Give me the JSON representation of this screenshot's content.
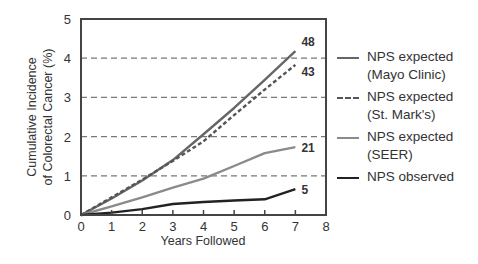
{
  "chart_data": {
    "type": "line",
    "title": "",
    "xlabel": "Years Followed",
    "ylabel": "Cumulative Incidence of Colorectal Cancer (%)",
    "ylabel_lines": [
      "Cumulative Incidence",
      "of Colorectal Cancer (%)"
    ],
    "xlim": [
      0,
      8
    ],
    "ylim": [
      0,
      5
    ],
    "xticks": [
      0,
      1,
      2,
      3,
      4,
      5,
      6,
      7,
      8
    ],
    "yticks": [
      0,
      1,
      2,
      3,
      4,
      5
    ],
    "grid": {
      "horizontal_dashed_at": [
        1,
        2,
        3,
        4
      ]
    },
    "legend_position": "right",
    "x": [
      0,
      1,
      2,
      3,
      4,
      5,
      6,
      7
    ],
    "series": [
      {
        "name": "NPS expected (Mayo Clinic)",
        "legend_lines": [
          "NPS expected",
          "(Mayo Clinic)"
        ],
        "style": "solid",
        "color": "#666666",
        "values": [
          0,
          0.42,
          0.88,
          1.4,
          2.06,
          2.73,
          3.45,
          4.18
        ],
        "end_label": "48"
      },
      {
        "name": "NPS expected (St. Mark's)",
        "legend_lines": [
          "NPS expected",
          "(St. Mark's)"
        ],
        "style": "dashed",
        "color": "#555555",
        "values": [
          0,
          0.45,
          0.9,
          1.38,
          1.88,
          2.55,
          3.2,
          3.83
        ],
        "end_label": "43"
      },
      {
        "name": "NPS expected (SEER)",
        "legend_lines": [
          "NPS expected",
          "(SEER)"
        ],
        "style": "solid",
        "color": "#8a8a8a",
        "values": [
          0,
          0.22,
          0.45,
          0.7,
          0.93,
          1.25,
          1.58,
          1.73
        ],
        "end_label": "21"
      },
      {
        "name": "NPS observed",
        "legend_lines": [
          "NPS observed"
        ],
        "style": "solid",
        "color": "#222222",
        "values": [
          0,
          0.06,
          0.15,
          0.28,
          0.33,
          0.37,
          0.4,
          0.66
        ],
        "end_label": "5"
      }
    ]
  }
}
